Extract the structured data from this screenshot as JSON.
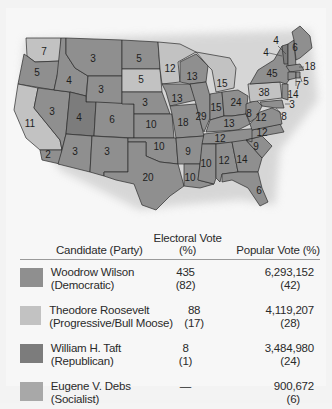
{
  "colors": {
    "wilson": "#8f8f8f",
    "roosevelt": "#c2c2c2",
    "taft": "#7c7c7c",
    "debs": "#a8a8a8",
    "background": "#f4f4f4"
  },
  "map": {
    "title": "",
    "states": [
      {
        "abbr": "WA",
        "ev": "7",
        "winner": "roosevelt"
      },
      {
        "abbr": "OR",
        "ev": "5",
        "winner": "wilson"
      },
      {
        "abbr": "CA",
        "ev": "11",
        "winner": "roosevelt"
      },
      {
        "abbr": "CA-south",
        "ev": "2",
        "winner": "wilson"
      },
      {
        "abbr": "ID",
        "ev": "4",
        "winner": "wilson"
      },
      {
        "abbr": "NV",
        "ev": "3",
        "winner": "wilson"
      },
      {
        "abbr": "MT",
        "ev": "3",
        "winner": "wilson"
      },
      {
        "abbr": "WY",
        "ev": "3",
        "winner": "wilson"
      },
      {
        "abbr": "UT",
        "ev": "4",
        "winner": "taft"
      },
      {
        "abbr": "CO",
        "ev": "6",
        "winner": "wilson"
      },
      {
        "abbr": "AZ",
        "ev": "3",
        "winner": "wilson"
      },
      {
        "abbr": "NM",
        "ev": "3",
        "winner": "wilson"
      },
      {
        "abbr": "ND",
        "ev": "5",
        "winner": "wilson"
      },
      {
        "abbr": "SD",
        "ev": "5",
        "winner": "roosevelt"
      },
      {
        "abbr": "NE",
        "ev": "3",
        "winner": "wilson"
      },
      {
        "abbr": "KS",
        "ev": "10",
        "winner": "wilson"
      },
      {
        "abbr": "OK",
        "ev": "10",
        "winner": "wilson"
      },
      {
        "abbr": "TX",
        "ev": "20",
        "winner": "wilson"
      },
      {
        "abbr": "MN",
        "ev": "12",
        "winner": "roosevelt"
      },
      {
        "abbr": "IA",
        "ev": "13",
        "winner": "wilson"
      },
      {
        "abbr": "MO",
        "ev": "18",
        "winner": "wilson"
      },
      {
        "abbr": "AR",
        "ev": "9",
        "winner": "wilson"
      },
      {
        "abbr": "LA",
        "ev": "10",
        "winner": "wilson"
      },
      {
        "abbr": "WI",
        "ev": "13",
        "winner": "wilson"
      },
      {
        "abbr": "IL",
        "ev": "29",
        "winner": "wilson"
      },
      {
        "abbr": "MI",
        "ev": "15",
        "winner": "roosevelt"
      },
      {
        "abbr": "IN",
        "ev": "15",
        "winner": "wilson"
      },
      {
        "abbr": "OH",
        "ev": "24",
        "winner": "wilson"
      },
      {
        "abbr": "KY",
        "ev": "13",
        "winner": "wilson"
      },
      {
        "abbr": "TN",
        "ev": "12",
        "winner": "wilson"
      },
      {
        "abbr": "MS",
        "ev": "10",
        "winner": "wilson"
      },
      {
        "abbr": "AL",
        "ev": "12",
        "winner": "wilson"
      },
      {
        "abbr": "GA",
        "ev": "14",
        "winner": "wilson"
      },
      {
        "abbr": "FL",
        "ev": "6",
        "winner": "wilson"
      },
      {
        "abbr": "SC",
        "ev": "9",
        "winner": "wilson"
      },
      {
        "abbr": "NC",
        "ev": "12",
        "winner": "wilson"
      },
      {
        "abbr": "VA",
        "ev": "12",
        "winner": "wilson"
      },
      {
        "abbr": "WV",
        "ev": "8",
        "winner": "wilson"
      },
      {
        "abbr": "PA",
        "ev": "38",
        "winner": "roosevelt"
      },
      {
        "abbr": "NY",
        "ev": "45",
        "winner": "wilson"
      },
      {
        "abbr": "VT",
        "ev": "4",
        "winner": "taft"
      },
      {
        "abbr": "NH",
        "ev": "4",
        "winner": "wilson"
      },
      {
        "abbr": "ME",
        "ev": "6",
        "winner": "wilson"
      },
      {
        "abbr": "MA",
        "ev": "18",
        "winner": "wilson"
      },
      {
        "abbr": "RI",
        "ev": "5",
        "winner": "wilson"
      },
      {
        "abbr": "CT",
        "ev": "7",
        "winner": "wilson"
      },
      {
        "abbr": "NJ",
        "ev": "14",
        "winner": "wilson"
      },
      {
        "abbr": "DE",
        "ev": "3",
        "winner": "wilson"
      },
      {
        "abbr": "MD",
        "ev": "8",
        "winner": "wilson"
      }
    ]
  },
  "legend": {
    "headers": {
      "candidate": "Candidate (Party)",
      "electoral": "Electoral Vote (%)",
      "popular": "Popular Vote (%)"
    },
    "rows": [
      {
        "name": "Woodrow Wilson",
        "party": "(Democratic)",
        "ev": "435",
        "ev_pct": "(82)",
        "pv": "6,293,152",
        "pv_pct": "(42)",
        "color_key": "wilson"
      },
      {
        "name": "Theodore Roosevelt",
        "party": "(Progressive/Bull Moose)",
        "ev": "88",
        "ev_pct": "(17)",
        "pv": "4,119,207",
        "pv_pct": "(28)",
        "color_key": "roosevelt"
      },
      {
        "name": "William H. Taft",
        "party": "(Republican)",
        "ev": "8",
        "ev_pct": "(1)",
        "pv": "3,484,980",
        "pv_pct": "(24)",
        "color_key": "taft"
      },
      {
        "name": "Eugene V. Debs",
        "party": "(Socialist)",
        "ev": "—",
        "ev_pct": "",
        "pv": "900,672",
        "pv_pct": "(6)",
        "color_key": "debs"
      }
    ]
  }
}
